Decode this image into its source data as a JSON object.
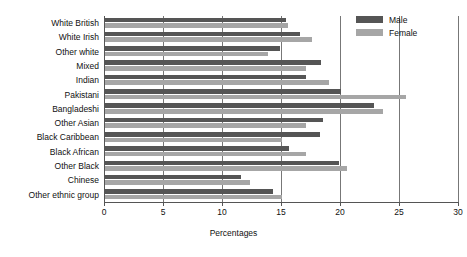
{
  "chart_data": {
    "type": "bar",
    "orientation": "horizontal",
    "title": "",
    "xlabel": "Percentages",
    "ylabel": "",
    "xlim": [
      0,
      30
    ],
    "xticks": [
      0,
      5,
      10,
      15,
      20,
      25,
      30
    ],
    "grid": true,
    "grid_axis": "x",
    "legend_position": "top-right",
    "categories": [
      "White British",
      "White Irish",
      "Other white",
      "Mixed",
      "Indian",
      "Pakistani",
      "Bangladeshi",
      "Other Asian",
      "Black Caribbean",
      "Black African",
      "Other Black",
      "Chinese",
      "Other ethnic group"
    ],
    "series": [
      {
        "name": "Male",
        "color": "#555555",
        "values": [
          15.3,
          16.5,
          14.8,
          18.3,
          17.0,
          20.0,
          22.8,
          18.5,
          18.2,
          15.6,
          19.8,
          11.5,
          14.2
        ]
      },
      {
        "name": "Female",
        "color": "#a6a6a6",
        "values": [
          15.5,
          17.5,
          13.8,
          17.0,
          19.0,
          25.5,
          23.6,
          17.0,
          15.0,
          17.0,
          20.5,
          12.3,
          15.0
        ]
      }
    ]
  },
  "legend": {
    "items": [
      {
        "label": "Male"
      },
      {
        "label": "Female"
      }
    ]
  }
}
